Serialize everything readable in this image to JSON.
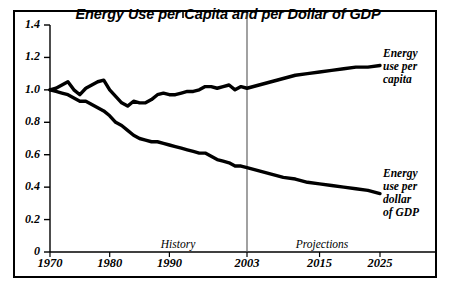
{
  "chart_data": {
    "type": "line",
    "title": "Energy Use per Capita and per Dollar of GDP",
    "xlabel": "",
    "ylabel": "",
    "xlim": [
      1970,
      2025
    ],
    "ylim": [
      0,
      1.4
    ],
    "grid": false,
    "legend_position": "inline-right",
    "ytick_labels": [
      "0",
      "0.2",
      "0.4",
      "0.6",
      "0.8",
      "1.0",
      "1.2",
      "1.4"
    ],
    "ytick_values": [
      0,
      0.2,
      0.4,
      0.6,
      0.8,
      1.0,
      1.2,
      1.4
    ],
    "xtick_labels": [
      "1970",
      "1980",
      "1990",
      "2003",
      "2015",
      "2025"
    ],
    "xtick_values": [
      1970,
      1980,
      1990,
      2003,
      2015,
      2025
    ],
    "annotations": [
      {
        "text": "History",
        "x": 1986
      },
      {
        "text": "Projections",
        "x": 2014
      },
      {
        "text": "2003",
        "type": "divider-line",
        "x": 2003
      }
    ],
    "series": [
      {
        "name": "Energy use per capita",
        "label_lines": [
          "Energy",
          "use per",
          "capita"
        ],
        "color": "#000000",
        "x": [
          1970,
          1971,
          1972,
          1973,
          1974,
          1975,
          1976,
          1977,
          1978,
          1979,
          1980,
          1981,
          1982,
          1983,
          1984,
          1985,
          1986,
          1987,
          1988,
          1989,
          1990,
          1991,
          1992,
          1993,
          1994,
          1995,
          1996,
          1997,
          1998,
          1999,
          2000,
          2001,
          2002,
          2003,
          2005,
          2007,
          2009,
          2011,
          2013,
          2015,
          2017,
          2019,
          2021,
          2023,
          2025
        ],
        "values": [
          1.0,
          1.01,
          1.03,
          1.05,
          1.0,
          0.97,
          1.01,
          1.03,
          1.05,
          1.06,
          1.0,
          0.96,
          0.92,
          0.9,
          0.93,
          0.92,
          0.92,
          0.94,
          0.97,
          0.98,
          0.97,
          0.97,
          0.98,
          0.99,
          0.99,
          1.0,
          1.02,
          1.02,
          1.01,
          1.02,
          1.03,
          1.0,
          1.02,
          1.01,
          1.03,
          1.05,
          1.07,
          1.09,
          1.1,
          1.11,
          1.12,
          1.13,
          1.14,
          1.14,
          1.15
        ]
      },
      {
        "name": "Energy use per dollar of GDP",
        "label_lines": [
          "Energy",
          "use per",
          "dollar",
          "of GDP"
        ],
        "color": "#000000",
        "x": [
          1970,
          1971,
          1972,
          1973,
          1974,
          1975,
          1976,
          1977,
          1978,
          1979,
          1980,
          1981,
          1982,
          1983,
          1984,
          1985,
          1986,
          1987,
          1988,
          1989,
          1990,
          1991,
          1992,
          1993,
          1994,
          1995,
          1996,
          1997,
          1998,
          1999,
          2000,
          2001,
          2002,
          2003,
          2005,
          2007,
          2009,
          2011,
          2013,
          2015,
          2017,
          2019,
          2021,
          2023,
          2025
        ],
        "values": [
          1.0,
          0.99,
          0.98,
          0.97,
          0.95,
          0.93,
          0.93,
          0.91,
          0.89,
          0.87,
          0.84,
          0.8,
          0.78,
          0.75,
          0.72,
          0.7,
          0.69,
          0.68,
          0.68,
          0.67,
          0.66,
          0.65,
          0.64,
          0.63,
          0.62,
          0.61,
          0.61,
          0.59,
          0.57,
          0.56,
          0.55,
          0.53,
          0.53,
          0.52,
          0.5,
          0.48,
          0.46,
          0.45,
          0.43,
          0.42,
          0.41,
          0.4,
          0.39,
          0.38,
          0.36
        ]
      }
    ]
  }
}
